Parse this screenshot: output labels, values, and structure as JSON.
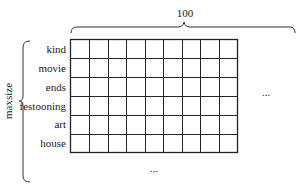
{
  "diagram": {
    "top_label": "100",
    "side_label": "maxsize",
    "row_labels": [
      "kind",
      "movie",
      "ends",
      "festooning",
      "art",
      "house"
    ],
    "columns": 9,
    "rows": 6,
    "right_ellipsis": "...",
    "bottom_ellipsis": "...",
    "colors": {
      "line": "#222222",
      "background": "#ffffff"
    }
  }
}
